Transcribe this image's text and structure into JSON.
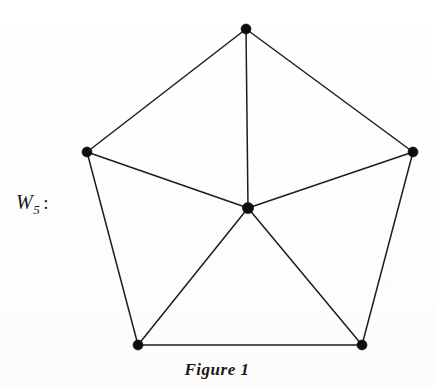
{
  "figure": {
    "label_base": "W",
    "label_subscript": "5",
    "label_colon": ":",
    "caption": "Figure 1",
    "background_color": "#fefefe",
    "edge_color": "#1d1d1d",
    "vertex_color": "#0d0d0d",
    "text_color": "#1a1a1a"
  },
  "chart_data": {
    "type": "diagram",
    "title": "Figure 1",
    "graph_name": "W5",
    "graph_family": "wheel graph",
    "vertex_count": 6,
    "edge_count": 10,
    "hub_degree": 5,
    "rim_degree": 3,
    "xlabel": "",
    "ylabel": "",
    "grid": false,
    "legend": false,
    "nodes": [
      {
        "id": "v1",
        "role": "rim",
        "x": 246,
        "y": 29,
        "radius": 5.0
      },
      {
        "id": "v2",
        "role": "rim",
        "x": 413,
        "y": 152,
        "radius": 5.0
      },
      {
        "id": "v3",
        "role": "rim",
        "x": 362,
        "y": 345,
        "radius": 5.0
      },
      {
        "id": "v4",
        "role": "rim",
        "x": 138,
        "y": 345,
        "radius": 5.0
      },
      {
        "id": "v5",
        "role": "rim",
        "x": 87,
        "y": 152,
        "radius": 5.0
      },
      {
        "id": "hub",
        "role": "hub",
        "x": 248,
        "y": 208,
        "radius": 5.6
      }
    ],
    "edges": [
      {
        "from": "v1",
        "to": "v2",
        "kind": "rim"
      },
      {
        "from": "v2",
        "to": "v3",
        "kind": "rim"
      },
      {
        "from": "v3",
        "to": "v4",
        "kind": "rim"
      },
      {
        "from": "v4",
        "to": "v5",
        "kind": "rim"
      },
      {
        "from": "v5",
        "to": "v1",
        "kind": "rim"
      },
      {
        "from": "hub",
        "to": "v1",
        "kind": "spoke"
      },
      {
        "from": "hub",
        "to": "v2",
        "kind": "spoke"
      },
      {
        "from": "hub",
        "to": "v3",
        "kind": "spoke"
      },
      {
        "from": "hub",
        "to": "v4",
        "kind": "spoke"
      },
      {
        "from": "hub",
        "to": "v5",
        "kind": "spoke"
      }
    ]
  }
}
